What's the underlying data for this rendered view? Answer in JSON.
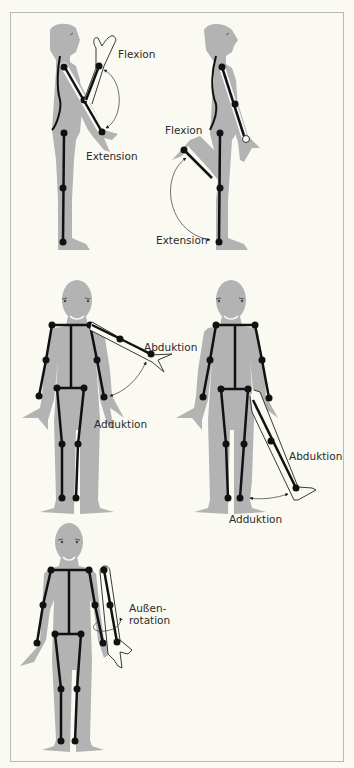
{
  "figure": {
    "colors": {
      "background": "#fbfaf2",
      "body": "#b3b3b3",
      "skeleton": "#111111",
      "frame": "#b9b9b4",
      "label": "#2a2a2a"
    },
    "panels": [
      {
        "id": "shoulder-flexion-extension",
        "view": "side",
        "labels": [
          "Flexion",
          "Extension"
        ]
      },
      {
        "id": "hip-flexion-extension",
        "view": "side",
        "labels": [
          "Flexion",
          "Extension"
        ]
      },
      {
        "id": "shoulder-abduction-adduction",
        "view": "front",
        "labels": [
          "Abduktion",
          "Adduktion"
        ]
      },
      {
        "id": "hip-abduction-adduction",
        "view": "front",
        "labels": [
          "Abduktion",
          "Adduktion"
        ]
      },
      {
        "id": "shoulder-external-rotation",
        "view": "front",
        "labels": [
          "Außen-",
          "rotation"
        ]
      }
    ]
  }
}
